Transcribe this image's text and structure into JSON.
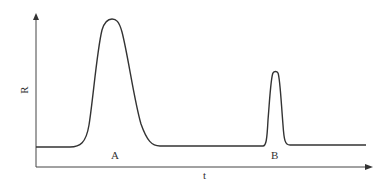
{
  "diagram": {
    "type": "chromatogram",
    "y_axis_label": "R",
    "x_axis_label": "t",
    "peaks": [
      {
        "label": "A",
        "description": "broad tall peak"
      },
      {
        "label": "B",
        "description": "narrow shorter peak"
      }
    ],
    "colors": {
      "line": "#333333",
      "background": "#ffffff"
    }
  }
}
